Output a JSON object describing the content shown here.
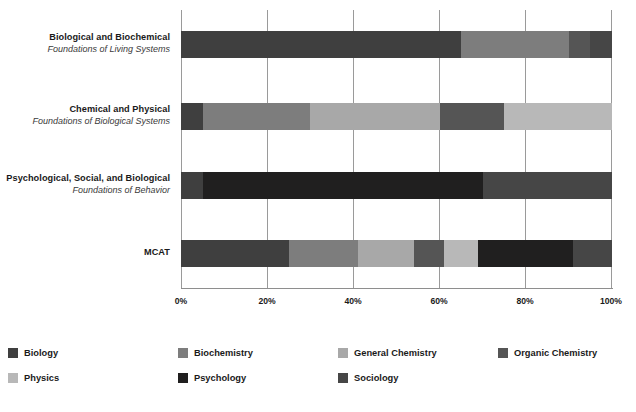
{
  "chart_data": {
    "type": "bar",
    "orientation": "horizontal",
    "stacked": true,
    "normalized": true,
    "title": "",
    "subtitle": "",
    "xlabel": "",
    "ylabel": "",
    "xlim": [
      0,
      100
    ],
    "grid": true,
    "legend_position": "bottom",
    "xticks": [
      0,
      20,
      40,
      60,
      80,
      100
    ],
    "xtick_labels": [
      "0%",
      "20%",
      "40%",
      "60%",
      "80%",
      "100%"
    ],
    "categories": [
      {
        "title": "Biological and Biochemical",
        "subtitle": "Foundations of Living Systems"
      },
      {
        "title": "Chemical and Physical",
        "subtitle": "Foundations of Biological Systems"
      },
      {
        "title": "Psychological, Social, and Biological",
        "subtitle": "Foundations of Behavior"
      },
      {
        "title": "MCAT",
        "subtitle": ""
      }
    ],
    "series": [
      {
        "name": "Biology",
        "color": "#3f3f3f",
        "values": [
          65,
          5,
          5,
          25
        ]
      },
      {
        "name": "Biochemistry",
        "color": "#7d7d7d",
        "values": [
          25,
          25,
          0,
          16
        ]
      },
      {
        "name": "General Chemistry",
        "color": "#a8a8a8",
        "values": [
          0,
          30,
          0,
          13
        ]
      },
      {
        "name": "Organic Chemistry",
        "color": "#555555",
        "values": [
          5,
          15,
          0,
          7
        ]
      },
      {
        "name": "Physics",
        "color": "#b8b8b8",
        "values": [
          0,
          25,
          0,
          8
        ]
      },
      {
        "name": "Psychology",
        "color": "#201f1f",
        "values": [
          0,
          0,
          65,
          22
        ]
      },
      {
        "name": "Sociology",
        "color": "#464646",
        "values": [
          5,
          0,
          30,
          9
        ]
      }
    ],
    "legend_entries": [
      {
        "label": "Biology",
        "color": "#3f3f3f"
      },
      {
        "label": "Biochemistry",
        "color": "#7d7d7d"
      },
      {
        "label": "General Chemistry",
        "color": "#a8a8a8"
      },
      {
        "label": "Organic Chemistry",
        "color": "#555555"
      },
      {
        "label": "Physics",
        "color": "#b8b8b8"
      },
      {
        "label": "Psychology",
        "color": "#201f1f"
      },
      {
        "label": "Sociology",
        "color": "#464646"
      }
    ]
  },
  "colors": {
    "background": "#ffffff",
    "gridline": "#9a9a9a",
    "axis": "#6d6d6d",
    "text": "#1a1a1a"
  },
  "layout": {
    "bar_tops": [
      31,
      103,
      172,
      240
    ],
    "legend_columns": [
      0,
      170,
      330,
      490
    ]
  }
}
